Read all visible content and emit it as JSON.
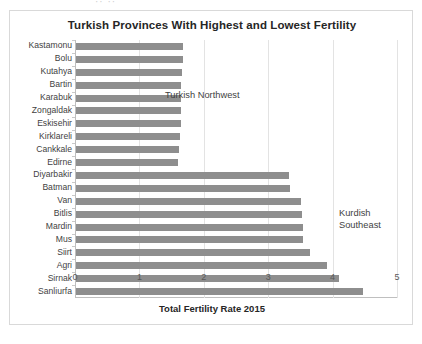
{
  "ghost_text": "··  ··",
  "chart_data": {
    "type": "bar",
    "orientation": "horizontal",
    "title": "Turkish Provinces With Highest and Lowest Fertility",
    "xlabel": "Total Fertility Rate 2015",
    "ylabel": "",
    "xlim": [
      0,
      5
    ],
    "xticks": [
      "0",
      "1",
      "2",
      "3",
      "4",
      "5"
    ],
    "grid": true,
    "legend": "none",
    "bar_color": "#8e8e8e",
    "categories": [
      "Kastamonu",
      "Bolu",
      "Kutahya",
      "Bartin",
      "Karabuk",
      "Zongaldak",
      "Eskisehir",
      "Kirklareli",
      "Cankkale",
      "Edirne",
      "Diyarbakir",
      "Batman",
      "Van",
      "Bitlis",
      "Mardin",
      "Mus",
      "Siirt",
      "Agri",
      "Sirnak",
      "Sanliurfa"
    ],
    "values": [
      1.66,
      1.66,
      1.65,
      1.63,
      1.63,
      1.63,
      1.63,
      1.61,
      1.6,
      1.59,
      3.3,
      3.32,
      3.5,
      3.51,
      3.52,
      3.53,
      3.64,
      3.89,
      4.08,
      4.45
    ],
    "annotations": [
      {
        "text": "Turkish Northwest",
        "group": "top-ten"
      },
      {
        "text": "Kurdish\nSoutheast",
        "group": "bottom-ten"
      }
    ]
  }
}
